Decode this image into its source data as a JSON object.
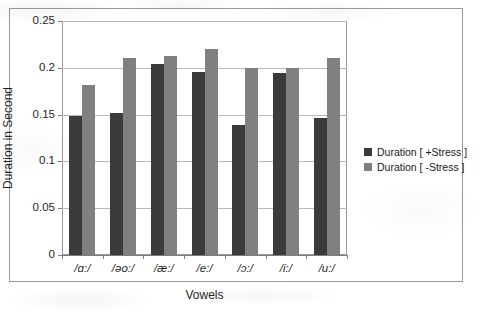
{
  "chart_data": {
    "type": "bar",
    "title": "",
    "xlabel": "Vowels",
    "ylabel": "Duration in Second",
    "categories": [
      "/ɑ:/",
      "/əo:/",
      "/æ:/",
      "/e:/",
      "/ɔ:/",
      "/i:/",
      "/u:/"
    ],
    "series": [
      {
        "name": "Duration [ +Stress ]",
        "color": "#3b3b3b",
        "values": [
          0.148,
          0.152,
          0.204,
          0.196,
          0.139,
          0.194,
          0.146
        ]
      },
      {
        "name": "Duration [ -Stress ]",
        "color": "#808080",
        "values": [
          0.182,
          0.21,
          0.213,
          0.22,
          0.2,
          0.2,
          0.211
        ]
      }
    ],
    "ylim": [
      0,
      0.25
    ],
    "yticks": [
      0,
      0.05,
      0.1,
      0.15,
      0.2,
      0.25
    ],
    "ytick_labels": [
      "0",
      "0.05",
      "0.1",
      "0.15",
      "0.2",
      "0.25"
    ],
    "grid": true,
    "grid_axis": "y",
    "legend_position": "right"
  }
}
